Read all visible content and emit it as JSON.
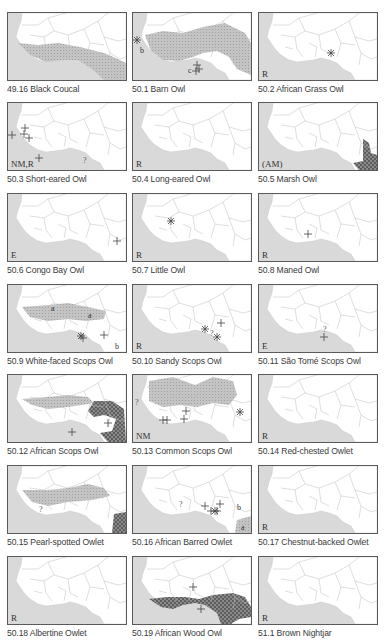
{
  "page": {
    "layout": {
      "columns_x": [
        7,
        132,
        258
      ],
      "rows_y": [
        12,
        102,
        193,
        284,
        374,
        465,
        556
      ]
    },
    "colors": {
      "frame_border": "#5a5a5a",
      "sea": "#d9d9d9",
      "land": "#ffffff",
      "borders": "#b8b8b8",
      "range_light": "#bdbdbd",
      "range_dark": "#6e6e6e",
      "symbol": "#444444",
      "caption": "#3a3a3a"
    }
  },
  "maps": [
    {
      "id": "49.16",
      "caption": "49.16 Black Coucal",
      "status": "",
      "range": "coucal",
      "symbols": [],
      "letters": []
    },
    {
      "id": "50.1",
      "caption": "50.1 Barn Owl",
      "status": "",
      "range": "sahel_wide",
      "symbols": [
        {
          "type": "star",
          "x": 4,
          "y": 27
        },
        {
          "type": "plus",
          "x": 64,
          "y": 52
        },
        {
          "type": "plus",
          "x": 66,
          "y": 56
        },
        {
          "type": "plus",
          "x": 63,
          "y": 58
        }
      ],
      "letters": [
        {
          "t": "b",
          "x": 7,
          "y": 40
        },
        {
          "t": "c",
          "x": 55,
          "y": 60
        }
      ]
    },
    {
      "id": "50.2",
      "caption": "50.2 African Grass Owl",
      "status": "R",
      "range": "",
      "symbols": [
        {
          "type": "star",
          "x": 72,
          "y": 40
        }
      ],
      "letters": []
    },
    {
      "id": "50.3",
      "caption": "50.3 Short-eared Owl",
      "status": "NM,R",
      "range": "",
      "symbols": [
        {
          "type": "plus",
          "x": 4,
          "y": 32
        },
        {
          "type": "plus",
          "x": 17,
          "y": 25
        },
        {
          "type": "plus",
          "x": 16,
          "y": 31
        },
        {
          "type": "plus",
          "x": 21,
          "y": 35
        },
        {
          "type": "plus",
          "x": 31,
          "y": 55
        },
        {
          "type": "q",
          "x": 77,
          "y": 57
        }
      ],
      "letters": []
    },
    {
      "id": "50.4",
      "caption": "50.4 Long-eared Owl",
      "status": "R",
      "range": "",
      "symbols": [],
      "letters": []
    },
    {
      "id": "50.5",
      "caption": "50.5 Marsh Owl",
      "status": "(AM)",
      "range": "marsh",
      "symbols": [],
      "letters": []
    },
    {
      "id": "50.6",
      "caption": "50.6 Congo Bay Owl",
      "status": "E",
      "range": "",
      "symbols": [
        {
          "type": "plus",
          "x": 109,
          "y": 47
        }
      ],
      "letters": []
    },
    {
      "id": "50.7",
      "caption": "50.7 Little Owl",
      "status": "R",
      "range": "",
      "symbols": [
        {
          "type": "star",
          "x": 38,
          "y": 27
        }
      ],
      "letters": []
    },
    {
      "id": "50.8",
      "caption": "50.8 Maned Owl",
      "status": "R",
      "range": "",
      "symbols": [
        {
          "type": "plus",
          "x": 49,
          "y": 40
        }
      ],
      "letters": []
    },
    {
      "id": "50.9",
      "caption": "50.9 White-faced Scops Owl",
      "status": "",
      "range": "whiteface",
      "symbols": [
        {
          "type": "star",
          "x": 73,
          "y": 51
        },
        {
          "type": "plus",
          "x": 75,
          "y": 53
        },
        {
          "type": "plus",
          "x": 96,
          "y": 50
        }
      ],
      "letters": [
        {
          "t": "a",
          "x": 43,
          "y": 26
        },
        {
          "t": "a",
          "x": 80,
          "y": 33
        },
        {
          "t": "b",
          "x": 107,
          "y": 64
        }
      ]
    },
    {
      "id": "50.10",
      "caption": "50.10 Sandy Scops Owl",
      "status": "R",
      "range": "",
      "symbols": [
        {
          "type": "star",
          "x": 72,
          "y": 44
        },
        {
          "type": "plus",
          "x": 88,
          "y": 38
        },
        {
          "type": "star",
          "x": 84,
          "y": 52
        },
        {
          "type": "q",
          "x": 79,
          "y": 48
        }
      ],
      "letters": []
    },
    {
      "id": "50.11",
      "caption": "50.11 São Tomé Scops Owl",
      "status": "E",
      "range": "",
      "symbols": [
        {
          "type": "q",
          "x": 66,
          "y": 44
        },
        {
          "type": "plus",
          "x": 65,
          "y": 52
        }
      ],
      "letters": []
    },
    {
      "id": "50.12",
      "caption": "50.12 African Scops Owl",
      "status": "",
      "range": "african_scops",
      "symbols": [
        {
          "type": "plus",
          "x": 64,
          "y": 57
        },
        {
          "type": "plus",
          "x": 100,
          "y": 48
        }
      ],
      "letters": []
    },
    {
      "id": "50.13",
      "caption": "50.13 Common Scops Owl",
      "status": "NM",
      "range": "common_scops",
      "symbols": [
        {
          "type": "q",
          "x": 4,
          "y": 27
        },
        {
          "type": "plus",
          "x": 30,
          "y": 45
        },
        {
          "type": "plus",
          "x": 34,
          "y": 45
        },
        {
          "type": "plus",
          "x": 53,
          "y": 36
        },
        {
          "type": "plus",
          "x": 51,
          "y": 44
        },
        {
          "type": "star",
          "x": 107,
          "y": 37
        }
      ],
      "letters": []
    },
    {
      "id": "50.14",
      "caption": "50.14 Red-chested Owlet",
      "status": "R",
      "range": "",
      "symbols": [],
      "letters": []
    },
    {
      "id": "50.15",
      "caption": "50.15 Pearl-spotted Owlet",
      "status": "",
      "range": "pearl",
      "symbols": [
        {
          "type": "q",
          "x": 33,
          "y": 43
        }
      ],
      "letters": []
    },
    {
      "id": "50.16",
      "caption": "50.16 African Barred Owlet",
      "status": "",
      "range": "barred",
      "symbols": [
        {
          "type": "q",
          "x": 48,
          "y": 38
        },
        {
          "type": "plus",
          "x": 72,
          "y": 40
        },
        {
          "type": "plus",
          "x": 78,
          "y": 45
        },
        {
          "type": "plus",
          "x": 87,
          "y": 38
        },
        {
          "type": "plus",
          "x": 84,
          "y": 45
        },
        {
          "type": "star",
          "x": 82,
          "y": 45
        }
      ],
      "letters": [
        {
          "t": "b",
          "x": 104,
          "y": 44
        },
        {
          "t": "a",
          "x": 108,
          "y": 64
        }
      ]
    },
    {
      "id": "50.17",
      "caption": "50.17 Chestnut-backed Owlet",
      "status": "R",
      "range": "",
      "symbols": [],
      "letters": []
    },
    {
      "id": "50.18",
      "caption": "50.18 Albertine Owlet",
      "status": "R",
      "range": "",
      "symbols": [],
      "letters": []
    },
    {
      "id": "50.19",
      "caption": "50.19 African Wood Owl",
      "status": "",
      "range": "wood",
      "symbols": [
        {
          "type": "plus",
          "x": 60,
          "y": 30
        },
        {
          "type": "plus",
          "x": 68,
          "y": 52
        }
      ],
      "letters": []
    },
    {
      "id": "51.1",
      "caption": "51.1 Brown Nightjar",
      "status": "R",
      "range": "",
      "symbols": [],
      "letters": []
    }
  ]
}
